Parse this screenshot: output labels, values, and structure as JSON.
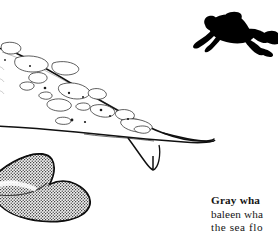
{
  "page": {
    "background_color": "#ffffff",
    "ink_color": "#000000",
    "width": 278,
    "height": 247,
    "medium": "pen-and-ink book illustration"
  },
  "illustration": {
    "subject": "gray-whale-with-scuba-diver",
    "whale": {
      "name": "gray whale",
      "outline_color": "#111111",
      "body_fill": "#ffffff",
      "barnacle_patch_color": "#2a2a2a",
      "barnacle_patch_count": 14,
      "speck_count": 9
    },
    "tail_fluke": {
      "name": "whale-tail-fluke",
      "fill_color": "#1a1a1a",
      "texture": "stipple",
      "position": "lower-left"
    },
    "diver": {
      "name": "scuba-diver-silhouette",
      "fill_color": "#000000",
      "position": "upper-right",
      "pose": "swimming-downward"
    }
  },
  "caption": {
    "lines": [
      "Gray wha",
      "baleen wha",
      "the sea flo"
    ],
    "clipped": true,
    "color": "#151515"
  }
}
